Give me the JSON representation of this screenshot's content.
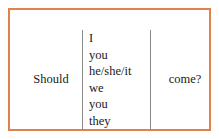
{
  "figure": {
    "type": "grammar-pattern-table",
    "frame_color": "#e0824c",
    "divider_color": "#8a8a8a",
    "text_color": "#1a1a1a",
    "background_color": "#ffffff"
  },
  "columns": {
    "auxiliary": {
      "label": "Should"
    },
    "subjects": {
      "items": [
        {
          "label": "I"
        },
        {
          "label": "you"
        },
        {
          "label": "he/she/it"
        },
        {
          "label": "we"
        },
        {
          "label": "you"
        },
        {
          "label": "they"
        }
      ]
    },
    "verb": {
      "label": "come?"
    }
  }
}
